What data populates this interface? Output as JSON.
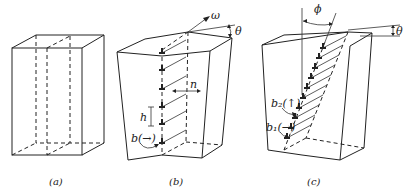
{
  "figure": {
    "panels": [
      {
        "id": "a",
        "caption": "(a)",
        "description": "Undeformed rectangular block with dashed internal plane"
      },
      {
        "id": "b",
        "caption": "(b)",
        "description": "Twist boundary: block rotated by angle theta about omega; row of edge dislocations spaced h along boundary with normal n",
        "labels": {
          "omega": "ω",
          "theta": "θ",
          "n": "n",
          "h": "h",
          "b": "b(→)"
        }
      },
      {
        "id": "c",
        "caption": "(c)",
        "description": "Tilted boundary at angle phi containing two dislocation sets b2 and b1",
        "labels": {
          "phi": "ϕ",
          "theta": "θ",
          "b2": "b₂(↑)",
          "b1": "b₁(→)"
        }
      }
    ]
  }
}
